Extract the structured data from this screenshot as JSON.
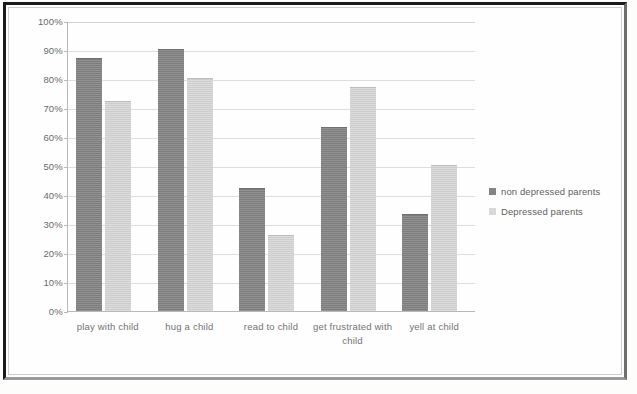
{
  "chart_data": {
    "type": "bar",
    "title": "",
    "subtitle": "",
    "xlabel": "",
    "ylabel": "",
    "ylim": [
      0,
      100
    ],
    "y_tick_labels": [
      "100%",
      "90%",
      "80%",
      "70%",
      "60%",
      "50%",
      "40%",
      "30%",
      "20%",
      "10%",
      "0%"
    ],
    "y_tick_values": [
      100,
      90,
      80,
      70,
      60,
      50,
      40,
      30,
      20,
      10,
      0
    ],
    "grid": true,
    "legend_position": "right",
    "categories": [
      "play with child",
      "hug a child",
      "read to child",
      "get frustrated with child",
      "yell at child"
    ],
    "series": [
      {
        "name": "non depressed parents",
        "color": "#848484",
        "values": [
          87,
          90,
          42,
          63,
          33
        ]
      },
      {
        "name": "Depressed parents",
        "color": "#d4d4d4",
        "values": [
          72,
          80,
          26,
          77,
          50
        ]
      }
    ]
  },
  "legend": {
    "entries": [
      {
        "label": "non depressed parents"
      },
      {
        "label": "Depressed parents"
      }
    ]
  }
}
